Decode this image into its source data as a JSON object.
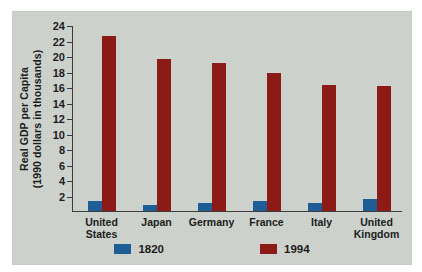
{
  "chart_data": {
    "type": "bar",
    "title": "",
    "subtitle": "",
    "xlabel": "",
    "ylabel": "Real GDP per Capita (1990 dollars in thousands)",
    "ylabel_lines": [
      "Real GDP per Capita",
      "(1990 dollars in thousands)"
    ],
    "categories": [
      "United States",
      "Japan",
      "Germany",
      "France",
      "Italy",
      "United Kingdom"
    ],
    "category_lines": [
      [
        "United",
        "States"
      ],
      [
        "Japan"
      ],
      [
        "Germany"
      ],
      [
        "France"
      ],
      [
        "Italy"
      ],
      [
        "United",
        "Kingdom"
      ]
    ],
    "series": [
      {
        "name": "1820",
        "color": "#1f5d96",
        "values": [
          1.2,
          0.7,
          1.0,
          1.2,
          1.0,
          1.5
        ]
      },
      {
        "name": "1994",
        "color": "#8c1a17",
        "values": [
          22.5,
          19.5,
          19.0,
          17.8,
          16.2,
          16.1
        ]
      }
    ],
    "ylim": [
      0,
      24
    ],
    "ytick_values": [
      2,
      4,
      6,
      8,
      10,
      12,
      14,
      16,
      18,
      20,
      22,
      24
    ],
    "ytick_labels": [
      "2",
      "4",
      "6",
      "8",
      "10",
      "12",
      "14",
      "16",
      "18",
      "20",
      "22",
      "24"
    ],
    "grid": false,
    "legend_position": "bottom",
    "legend_entries": [
      {
        "label": "1820",
        "color": "#1f5d96"
      },
      {
        "label": "1994",
        "color": "#8c1a17"
      }
    ],
    "background_color": "#cdd2cc",
    "axis_color": "#3b3b3b",
    "text_color": "#1c1c1c"
  }
}
